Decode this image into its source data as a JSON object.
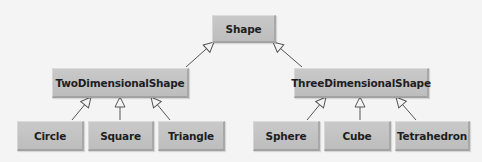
{
  "diagram": {
    "type": "uml-class-hierarchy",
    "colors": {
      "background": "#f4f4f4",
      "box_fill": "#c4c4c4",
      "text": "#1e1e1e",
      "edge": "#555555"
    },
    "nodes": {
      "shape": {
        "label": "Shape"
      },
      "two_d": {
        "label": "TwoDimensionalShape"
      },
      "three_d": {
        "label": "ThreeDimensionalShape"
      },
      "circle": {
        "label": "Circle"
      },
      "square": {
        "label": "Square"
      },
      "triangle": {
        "label": "Triangle"
      },
      "sphere": {
        "label": "Sphere"
      },
      "cube": {
        "label": "Cube"
      },
      "tetrahedron": {
        "label": "Tetrahedron"
      }
    },
    "edges": [
      {
        "from": "TwoDimensionalShape",
        "to": "Shape",
        "kind": "generalization"
      },
      {
        "from": "ThreeDimensionalShape",
        "to": "Shape",
        "kind": "generalization"
      },
      {
        "from": "Circle",
        "to": "TwoDimensionalShape",
        "kind": "generalization"
      },
      {
        "from": "Square",
        "to": "TwoDimensionalShape",
        "kind": "generalization"
      },
      {
        "from": "Triangle",
        "to": "TwoDimensionalShape",
        "kind": "generalization"
      },
      {
        "from": "Sphere",
        "to": "ThreeDimensionalShape",
        "kind": "generalization"
      },
      {
        "from": "Cube",
        "to": "ThreeDimensionalShape",
        "kind": "generalization"
      },
      {
        "from": "Tetrahedron",
        "to": "ThreeDimensionalShape",
        "kind": "generalization"
      }
    ]
  }
}
